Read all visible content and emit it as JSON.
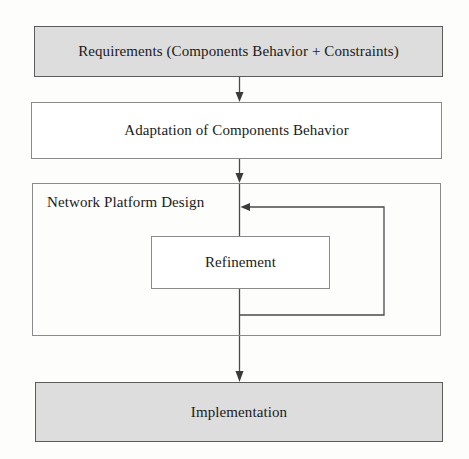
{
  "diagram": {
    "colors": {
      "shaded_fill": "#dddddd",
      "box_stroke": "#6f6f6f",
      "edge_stroke": "#4a4a4a",
      "text": "#1a1a1a",
      "background": "#fdfdfc"
    },
    "nodes": [
      {
        "id": "requirements",
        "label": "Requirements (Components Behavior + Constraints)",
        "style": "shaded",
        "x": 34,
        "y": 26,
        "w": 409,
        "h": 51
      },
      {
        "id": "adaptation",
        "label": "Adaptation of Components Behavior",
        "style": "plain",
        "x": 31,
        "y": 102,
        "w": 411,
        "h": 57
      },
      {
        "id": "network_platform_design",
        "label": "Network Platform Design",
        "style": "container",
        "x": 32,
        "y": 183,
        "w": 409,
        "h": 153
      },
      {
        "id": "refinement",
        "label": "Refinement",
        "style": "plain",
        "x": 151,
        "y": 236,
        "w": 179,
        "h": 53
      },
      {
        "id": "implementation",
        "label": "Implementation",
        "style": "shaded",
        "x": 35,
        "y": 382,
        "w": 408,
        "h": 60
      }
    ],
    "edges": [
      {
        "id": "requirements-to-adaptation",
        "from": "requirements",
        "to": "adaptation",
        "kind": "straight-down-arrow"
      },
      {
        "id": "adaptation-to-network",
        "from": "adaptation",
        "to": "network_platform_design",
        "kind": "straight-down-arrow"
      },
      {
        "id": "network-through-refinement",
        "from": "network_platform_design",
        "to": "refinement",
        "kind": "straight-down"
      },
      {
        "id": "refinement-feedback-loop",
        "from": "refinement",
        "to": "network_platform_design",
        "kind": "feedback-loop-left-arrow"
      },
      {
        "id": "network-to-implementation",
        "from": "network_platform_design",
        "to": "implementation",
        "kind": "straight-down-arrow"
      }
    ]
  }
}
